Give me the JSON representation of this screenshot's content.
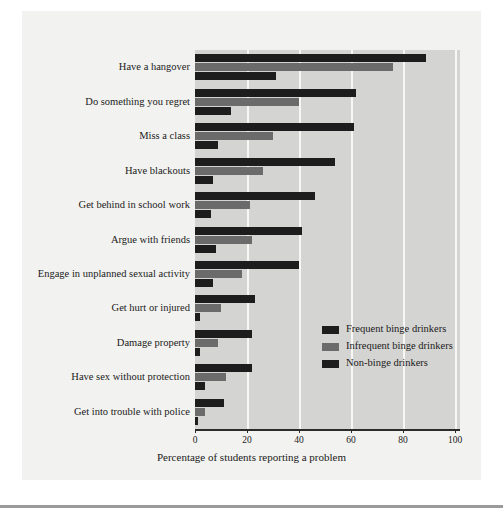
{
  "figure": {
    "background_color": "#f2f2f0",
    "plot_background_color": "#d4d4d2",
    "gridline_color": "#f7f7f5"
  },
  "chart_data": {
    "type": "bar",
    "orientation": "horizontal",
    "title": "",
    "subtitle": "",
    "xlabel": "Percentage of students reporting a problem",
    "ylabel": "",
    "xlim": [
      0,
      100
    ],
    "xticks": [
      0,
      20,
      40,
      60,
      80,
      100
    ],
    "xtick_labels": [
      "0",
      "20",
      "40",
      "60",
      "80",
      "100"
    ],
    "grid": true,
    "grid_axis": "x",
    "legend_position": "inside-lower-right",
    "categories": [
      "Have a hangover",
      "Do something you regret",
      "Miss a class",
      "Have blackouts",
      "Get behind in school work",
      "Argue with friends",
      "Engage in unplanned sexual activity",
      "Get hurt or injured",
      "Damage property",
      "Have sex without protection",
      "Get into trouble with police"
    ],
    "series": [
      {
        "name": "Frequent binge drinkers",
        "color": "#1d1d1d",
        "values": [
          89,
          62,
          61,
          54,
          46,
          41,
          40,
          23,
          22,
          22,
          11
        ]
      },
      {
        "name": "Infrequent binge drinkers",
        "color": "#6b6b6b",
        "values": [
          76,
          40,
          30,
          26,
          21,
          22,
          18,
          10,
          9,
          12,
          4
        ]
      },
      {
        "name": "Non-binge drinkers",
        "color": "#1d1d1d",
        "values": [
          31,
          14,
          9,
          7,
          6,
          8,
          7,
          2,
          2,
          4,
          1
        ]
      }
    ]
  },
  "legend": {
    "entries": [
      {
        "label": "Frequent binge drinkers",
        "color": "#1d1d1d"
      },
      {
        "label": "Infrequent binge drinkers",
        "color": "#6b6b6b"
      },
      {
        "label": "Non-binge drinkers",
        "color": "#1d1d1d"
      }
    ]
  }
}
